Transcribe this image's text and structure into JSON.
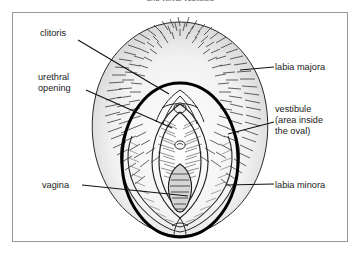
{
  "caption": {
    "cut_text": "and vulval vestibule"
  },
  "figure": {
    "ink_color": "#1a1a1a",
    "oval_color": "#000000",
    "frame_color": "#9a9a9a",
    "background": "#ffffff"
  },
  "labels": {
    "clitoris": "clitoris",
    "urethral_opening_line1": "urethral",
    "urethral_opening_line2": "opening",
    "vagina": "vagina",
    "labia_majora": "labia majora",
    "vestibule_line1": "vestibule",
    "vestibule_line2": "(area inside",
    "vestibule_line3": "the oval)",
    "labia_minora": "labia minora"
  }
}
